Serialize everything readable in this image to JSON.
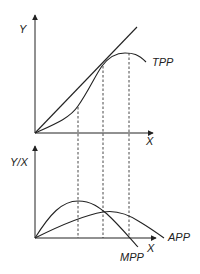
{
  "top_panel": {
    "y_axis_label": "Y",
    "x_axis_label": "X",
    "curve_label": "TPP"
  },
  "bottom_panel": {
    "y_axis_label": "Y/X",
    "x_axis_label": "X",
    "curve_labels": {
      "average": "APP",
      "marginal": "MPP"
    }
  },
  "colors": {
    "line": "#222222",
    "background": "#ffffff"
  }
}
